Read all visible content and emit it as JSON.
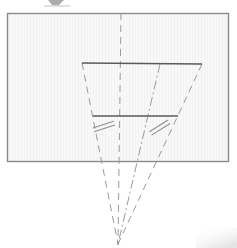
{
  "figure": {
    "title": "Perspective projection geometry diagram",
    "caption": "",
    "background_color": "#ffffff",
    "panel": {
      "name": "image-plane-rectangle",
      "fill_color": "#f7f7f7",
      "stroke_color": "#8a8a8a",
      "texture": "faint-vertical-stripes",
      "x": 7,
      "y": 13,
      "width": 222,
      "height": 149
    },
    "line_colors": {
      "solid": "#5a5a5a",
      "dashed": "#9a9a9a",
      "dashdot": "#9a9a9a",
      "tick": "#8f8f8f"
    },
    "vanishing_point": {
      "name": "vanishing-point",
      "x": 118,
      "y": 244
    },
    "solid_segments": [
      {
        "name": "trapezoid-top-edge",
        "x1": 82,
        "y1": 63,
        "x2": 202,
        "y2": 64
      },
      {
        "name": "trapezoid-lower-edge",
        "x1": 93,
        "y1": 116,
        "x2": 178,
        "y2": 116
      }
    ],
    "dashed_segments": [
      {
        "name": "center-axis-line",
        "x1": 121,
        "y1": 13,
        "x2": 118,
        "y2": 244
      },
      {
        "name": "left-projection-ray",
        "x1": 82,
        "y1": 63,
        "x2": 118,
        "y2": 244
      },
      {
        "name": "right-projection-ray",
        "x1": 202,
        "y1": 64,
        "x2": 118,
        "y2": 244
      }
    ],
    "dashdot_segments": [
      {
        "name": "interior-projection-ray",
        "x1": 160,
        "y1": 64,
        "x2": 118,
        "y2": 244
      }
    ],
    "tick_marks": [
      {
        "name": "congruence-tick-left",
        "cx": 104,
        "cy": 127,
        "angle": -18,
        "count": 2
      },
      {
        "name": "congruence-tick-right",
        "cx": 160,
        "cy": 128,
        "angle": -32,
        "count": 2
      }
    ],
    "artifacts": [
      {
        "name": "top-scan-artifact",
        "x": 48,
        "y": 0,
        "width": 16,
        "height": 7,
        "color": "#9c9c9c"
      },
      {
        "name": "corner-smudge-artifact",
        "x": 196,
        "y": 228,
        "width": 41,
        "height": 20,
        "color": "#ededed"
      }
    ]
  }
}
